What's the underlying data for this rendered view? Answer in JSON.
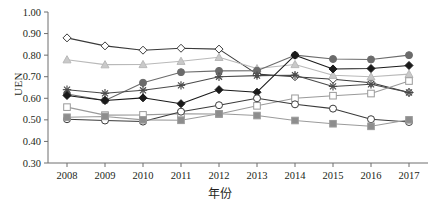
{
  "chart_data": {
    "type": "line",
    "title": "",
    "xlabel": "年份",
    "ylabel": "UEN",
    "categories": [
      "2008",
      "2009",
      "2010",
      "2011",
      "2012",
      "2013",
      "2014",
      "2015",
      "2016",
      "2017"
    ],
    "x": [
      2008,
      2009,
      2010,
      2011,
      2012,
      2013,
      2014,
      2015,
      2016,
      2017
    ],
    "ylim": [
      0.3,
      1.0
    ],
    "ytick_labels": [
      "0.30",
      "0.40",
      "0.50",
      "0.60",
      "0.70",
      "0.80",
      "0.90",
      "1.00"
    ],
    "ytick_values": [
      0.3,
      0.4,
      0.5,
      0.6,
      0.7,
      0.8,
      0.9,
      1.0
    ],
    "grid": false,
    "legend": "none",
    "series": [
      {
        "name": "series-open-diamond",
        "marker": "open-diamond",
        "color": "#3a3a3a",
        "fill": "#ffffff",
        "values": [
          0.88,
          0.843,
          0.823,
          0.832,
          0.828,
          0.712,
          0.7,
          0.688,
          0.672,
          0.627
        ]
      },
      {
        "name": "series-light-triangle",
        "marker": "light-triangle",
        "color": "#b9b9b9",
        "fill": "#c9c9c9",
        "values": [
          0.779,
          0.756,
          0.757,
          0.772,
          0.79,
          0.738,
          0.757,
          0.707,
          0.7,
          0.712
        ]
      },
      {
        "name": "series-gray-circle",
        "marker": "gray-filled-circle",
        "color": "#6b6b6b",
        "fill": "#6b6b6b",
        "values": [
          0.62,
          0.59,
          0.672,
          0.721,
          0.727,
          0.728,
          0.8,
          0.782,
          0.78,
          0.8
        ]
      },
      {
        "name": "series-asterisk",
        "marker": "asterisk",
        "color": "#4a4a4a",
        "fill": "#4a4a4a",
        "values": [
          0.64,
          0.623,
          0.637,
          0.66,
          0.7,
          0.705,
          0.707,
          0.655,
          0.665,
          0.627
        ]
      },
      {
        "name": "series-dark-diamond",
        "marker": "dark-filled-diamond",
        "color": "#1a1a1a",
        "fill": "#1a1a1a",
        "values": [
          0.613,
          0.59,
          0.602,
          0.575,
          0.64,
          0.628,
          0.8,
          0.736,
          0.738,
          0.752
        ]
      },
      {
        "name": "series-open-square",
        "marker": "open-square",
        "color": "#9a9a9a",
        "fill": "#ffffff",
        "values": [
          0.559,
          0.522,
          0.523,
          0.528,
          0.527,
          0.565,
          0.6,
          0.612,
          0.622,
          0.68
        ]
      },
      {
        "name": "series-open-circle",
        "marker": "open-circle",
        "color": "#3a3a3a",
        "fill": "#ffffff",
        "values": [
          0.503,
          0.497,
          0.492,
          0.538,
          0.568,
          0.6,
          0.572,
          0.552,
          0.503,
          0.49
        ]
      },
      {
        "name": "series-gray-square",
        "marker": "gray-filled-square",
        "color": "#9b9b9b",
        "fill": "#8d8d8d",
        "values": [
          0.512,
          0.516,
          0.5,
          0.498,
          0.528,
          0.52,
          0.497,
          0.482,
          0.47,
          0.5
        ]
      }
    ]
  }
}
